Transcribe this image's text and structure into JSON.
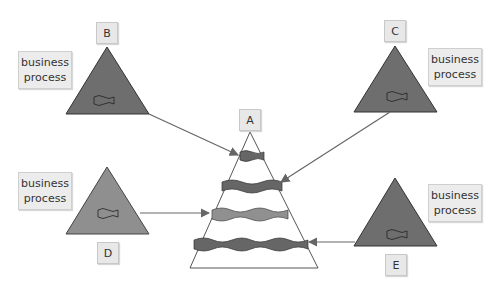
{
  "diagram": {
    "central_process": {
      "label": "A"
    },
    "processes": [
      {
        "id": "B",
        "label": "B",
        "description": "business\nprocess",
        "color": "#6e6e6e"
      },
      {
        "id": "C",
        "label": "C",
        "description": "business\nprocess",
        "color": "#6e6e6e"
      },
      {
        "id": "D",
        "label": "D",
        "description": "business\nprocess",
        "color": "#8f8f8f"
      },
      {
        "id": "E",
        "label": "E",
        "description": "business\nprocess",
        "color": "#6e6e6e"
      }
    ],
    "colors": {
      "dark_fill": "#6e6e6e",
      "light_fill": "#8f8f8f",
      "arrow": "#666666",
      "box_bg": "#ececec"
    }
  }
}
